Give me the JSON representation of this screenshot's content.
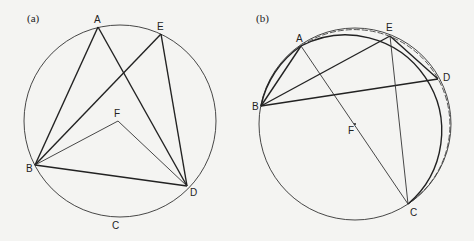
{
  "panels": [
    {
      "id": "a",
      "label": "(a)",
      "circle": {
        "cx": 120,
        "cy": 121,
        "r": 96
      },
      "points": {
        "A": {
          "x": 98,
          "y": 27,
          "label": "A"
        },
        "E": {
          "x": 161,
          "y": 34,
          "label": "E"
        },
        "B": {
          "x": 35,
          "y": 165,
          "label": "B"
        },
        "D": {
          "x": 187,
          "y": 186,
          "label": "D"
        },
        "F": {
          "x": 118,
          "y": 121,
          "label": "F"
        },
        "C": {
          "x": 115,
          "y": 225,
          "label": "C"
        }
      },
      "segments_thick": [
        [
          "A",
          "B"
        ],
        [
          "A",
          "D"
        ],
        [
          "E",
          "B"
        ],
        [
          "E",
          "D"
        ],
        [
          "B",
          "D"
        ]
      ],
      "segments_thin": [
        [
          "F",
          "B"
        ],
        [
          "F",
          "D"
        ]
      ]
    },
    {
      "id": "b",
      "label": "(b)",
      "circle": {
        "cx": 355,
        "cy": 124,
        "r": 96
      },
      "points": {
        "A": {
          "x": 301,
          "y": 46,
          "label": "A"
        },
        "E": {
          "x": 390,
          "y": 36,
          "label": "E"
        },
        "D": {
          "x": 438,
          "y": 79,
          "label": "D"
        },
        "B": {
          "x": 261,
          "y": 106,
          "label": "B"
        },
        "C": {
          "x": 408,
          "y": 204,
          "label": "C"
        },
        "F": {
          "x": 355,
          "y": 124,
          "label": "F"
        }
      },
      "segments_thick": [
        [
          "B",
          "A"
        ],
        [
          "B",
          "E"
        ],
        [
          "B",
          "D"
        ],
        [
          "E",
          "D"
        ]
      ],
      "segments_thin": [
        [
          "A",
          "C"
        ],
        [
          "E",
          "C"
        ]
      ],
      "dashed_arc": "second circle through A, E, D, C drawn dashed"
    }
  ]
}
